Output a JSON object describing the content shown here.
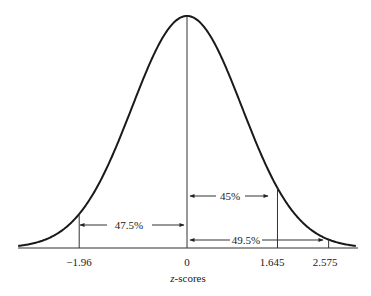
{
  "chart_data": {
    "type": "line",
    "title": "",
    "xlabel": "z-scores",
    "ylabel": "",
    "mean": 0,
    "sd": 1,
    "tick_labels": [
      "−1.96",
      "0",
      "1.645",
      "2.575"
    ],
    "tick_values": [
      -1.96,
      0,
      1.645,
      2.575
    ],
    "annotations": [
      {
        "label": "47.5%",
        "from": -1.96,
        "to": 0
      },
      {
        "label": "45%",
        "from": 0,
        "to": 1.645
      },
      {
        "label": "49.5%",
        "from": 0,
        "to": 2.575
      }
    ],
    "grid": false,
    "legend": null
  },
  "axis": {
    "xlabel_italic": "z",
    "xlabel_rest": "-scores"
  }
}
